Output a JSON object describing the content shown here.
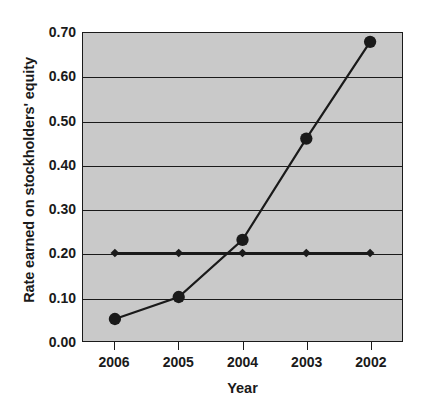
{
  "chart_data": {
    "type": "line",
    "title": "",
    "xlabel": "Year",
    "ylabel": "Rate earned on stockholders' equity",
    "categories": [
      "2006",
      "2005",
      "2004",
      "2003",
      "2002"
    ],
    "ylim": [
      0.0,
      0.7
    ],
    "yticks": [
      "0.00",
      "0.10",
      "0.20",
      "0.30",
      "0.40",
      "0.50",
      "0.60",
      "0.70"
    ],
    "ytick_values": [
      0.0,
      0.1,
      0.2,
      0.3,
      0.4,
      0.5,
      0.6,
      0.7
    ],
    "grid": true,
    "legend": "none",
    "series": [
      {
        "name": "Rate earned on stockholders' equity",
        "marker": "circle",
        "values": [
          0.05,
          0.1,
          0.23,
          0.46,
          0.68
        ]
      },
      {
        "name": "Benchmark",
        "marker": "diamond",
        "values": [
          0.2,
          0.2,
          0.2,
          0.2,
          0.2
        ]
      }
    ],
    "colors": {
      "plot_background": "#c9c9c9",
      "figure_background": "#ffffff",
      "line": "#1a1a1a",
      "grid": "#1a1a1a",
      "text": "#1a1a1a"
    }
  }
}
